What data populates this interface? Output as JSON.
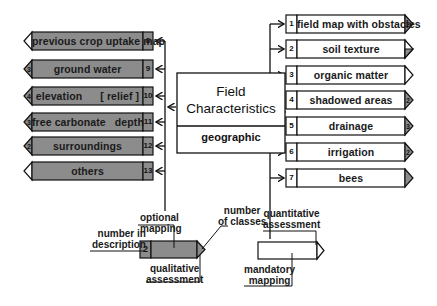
{
  "center": {
    "title_line1": "Field",
    "title_line2": "Characteristics",
    "subtitle": "geographic"
  },
  "left_items": [
    {
      "number": "8",
      "label": "previous crop uptake map",
      "tip": "",
      "tip_fill": "#ffffff"
    },
    {
      "number": "9",
      "label": "ground water",
      "tip": "3",
      "tip_fill": "#8c8c8c"
    },
    {
      "number": "10",
      "label": "elevation      [ relief ]",
      "tip": "4",
      "tip_fill": "#8c8c8c"
    },
    {
      "number": "11",
      "label": "free carbonate   depth",
      "tip": "3",
      "tip_fill": "#8c8c8c"
    },
    {
      "number": "12",
      "label": "surroundings",
      "tip": "2",
      "tip_fill": "#8c8c8c"
    },
    {
      "number": "13",
      "label": "others",
      "tip": "",
      "tip_fill": "#ffffff"
    }
  ],
  "right_items": [
    {
      "number": "1",
      "label": "field map with obstacles",
      "tip": "2",
      "tip_fill": "#8c8c8c"
    },
    {
      "number": "2",
      "label": "soil texture",
      "tip": "",
      "tip_fill": "half"
    },
    {
      "number": "3",
      "label": "organic matter",
      "tip": "",
      "tip_fill": "#ffffff"
    },
    {
      "number": "4",
      "label": "shadowed areas",
      "tip": "2",
      "tip_fill": "#8c8c8c"
    },
    {
      "number": "5",
      "label": "drainage",
      "tip": "3",
      "tip_fill": "#8c8c8c"
    },
    {
      "number": "6",
      "label": "irrigation",
      "tip": "2",
      "tip_fill": "#8c8c8c"
    },
    {
      "number": "7",
      "label": "bees",
      "tip": "",
      "tip_fill": "#8c8c8c"
    }
  ],
  "legend": {
    "sample_number": "2",
    "optional_mapping": [
      "optional",
      "mapping"
    ],
    "number_in_description": [
      "number in",
      "description"
    ],
    "number_of_classes": [
      "number",
      "of classes"
    ],
    "qualitative_assessment": [
      "qualitative",
      "assessment"
    ],
    "quantitative_assessment": [
      "quantitative",
      "assessment"
    ],
    "mandatory_mapping": [
      "mandatory",
      "mapping"
    ]
  },
  "colors": {
    "optional_fill": "#8c8c8c",
    "mandatory_fill": "#ffffff",
    "stroke": "#111111"
  }
}
